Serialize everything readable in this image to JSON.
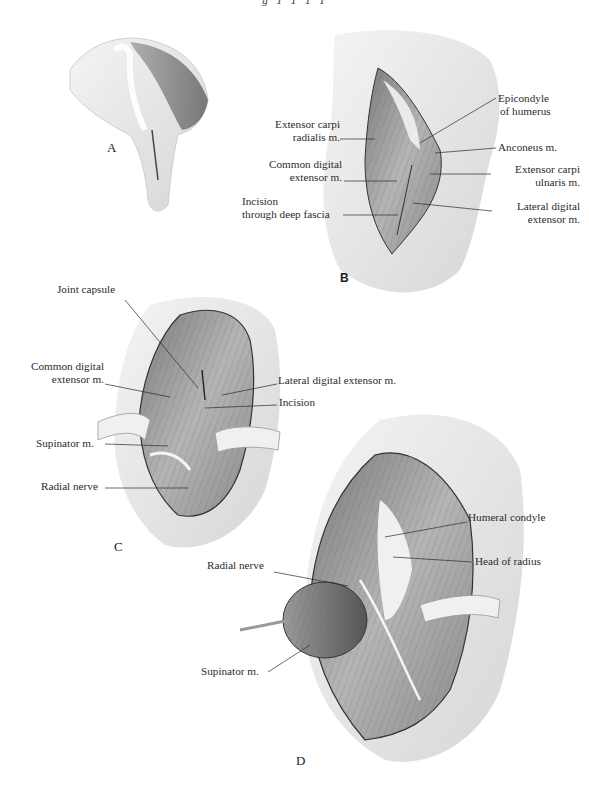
{
  "header": {
    "text": "g 1 1 1 1"
  },
  "figure": {
    "panels": [
      {
        "id": "A",
        "letter": "A",
        "labels": []
      },
      {
        "id": "B",
        "letter": "B",
        "labels": [
          {
            "key": "epicondyle",
            "line1": "Epicondyle",
            "line2": "of humerus"
          },
          {
            "key": "ecr",
            "line1": "Extensor carpi",
            "line2": "radialis m."
          },
          {
            "key": "anconeus",
            "line1": "Anconeus m."
          },
          {
            "key": "cde",
            "line1": "Common digital",
            "line2": "extensor m."
          },
          {
            "key": "ecu",
            "line1": "Extensor carpi",
            "line2": "ulnaris m."
          },
          {
            "key": "incision_fascia",
            "line1": "Incision",
            "line2": "through deep fascia"
          },
          {
            "key": "lde",
            "line1": "Lateral digital",
            "line2": "extensor m."
          }
        ]
      },
      {
        "id": "C",
        "letter": "C",
        "labels": [
          {
            "key": "joint_capsule",
            "line1": "Joint capsule"
          },
          {
            "key": "cde",
            "line1": "Common digital",
            "line2": "extensor m."
          },
          {
            "key": "lde",
            "line1": "Lateral digital extensor m."
          },
          {
            "key": "incision",
            "line1": "Incision"
          },
          {
            "key": "supinator",
            "line1": "Supinator m."
          },
          {
            "key": "radial_nerve",
            "line1": "Radial nerve"
          }
        ]
      },
      {
        "id": "D",
        "letter": "D",
        "labels": [
          {
            "key": "humeral_condyle",
            "line1": "Humeral condyle"
          },
          {
            "key": "head_radius",
            "line1": "Head of radius"
          },
          {
            "key": "radial_nerve",
            "line1": "Radial nerve"
          },
          {
            "key": "supinator",
            "line1": "Supinator m."
          }
        ]
      }
    ]
  },
  "colors": {
    "background": "#ffffff",
    "ink": "#2b2b2b",
    "shade_dark": "#6e6e6e",
    "shade_mid": "#a9a9a9",
    "shade_light": "#e4e4e4"
  }
}
